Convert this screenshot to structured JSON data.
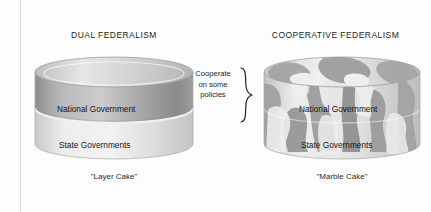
{
  "figure": {
    "type": "diagram",
    "panels": [
      {
        "id": "dual",
        "title": "DUAL FEDERALISM",
        "caption": "\"Layer Cake\"",
        "cake_style": "layer",
        "layers": [
          {
            "name": "National Government",
            "position": "top",
            "shade": "dark-gray"
          },
          {
            "name": "State Governments",
            "position": "bottom",
            "shade": "light-gray"
          }
        ]
      },
      {
        "id": "cooperative",
        "title": "COOPERATIVE FEDERALISM",
        "caption": "\"Marble Cake\"",
        "cake_style": "marble",
        "layers": [
          {
            "name": "National Government",
            "position": "top",
            "shade": "marbled"
          },
          {
            "name": "State Governments",
            "position": "bottom",
            "shade": "marbled"
          }
        ]
      }
    ],
    "annotation": {
      "line1": "Cooperate",
      "line2": "on some",
      "line3": "policies",
      "marker": "right-curly-brace"
    },
    "colors": {
      "cake_dark": "#9a9a9a",
      "cake_light": "#dcdcdc",
      "cake_top": "#cfcfcf",
      "marble_dark": "#8f8f8f",
      "marble_light": "#e2e2e2",
      "text": "#1d1d1d",
      "rule": "#d9d9d9",
      "background": "#fdfdfd"
    }
  }
}
